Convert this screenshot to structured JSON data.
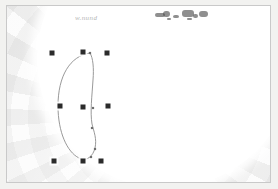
{
  "image": {
    "kind": "scanned-plate",
    "width": 278,
    "height": 189,
    "background_color": "#f2f2f0",
    "plate_color": "#fafafa",
    "frame_color": "#c9c9c9",
    "disc_color": "#ffffff",
    "marker_color": "#2b2b2b",
    "curve_color": "#8d8d8d",
    "node_color": "#6e6e6e",
    "ink_color": "#4a4a4a"
  },
  "annotation": {
    "handwriting_text": "w.nund",
    "handwriting_x": 68,
    "handwriting_y": 8
  },
  "markers": {
    "label": "square-marker",
    "size": 5,
    "points": [
      {
        "id": "m-r1c1",
        "x": 45,
        "y": 47
      },
      {
        "id": "m-r1c2",
        "x": 76,
        "y": 46
      },
      {
        "id": "m-r1c3",
        "x": 100,
        "y": 47
      },
      {
        "id": "m-r2c1",
        "x": 53,
        "y": 100
      },
      {
        "id": "m-r2c2",
        "x": 76,
        "y": 101
      },
      {
        "id": "m-r2c3",
        "x": 101,
        "y": 100
      },
      {
        "id": "m-r3c1",
        "x": 47,
        "y": 155
      },
      {
        "id": "m-r3c2",
        "x": 76,
        "y": 155
      },
      {
        "id": "m-r3c3",
        "x": 94,
        "y": 155
      }
    ]
  },
  "curve": {
    "label": "closed-outline-path",
    "path": "M 83 47 C 63 50 51 70 51 100 C 51 126 60 146 72 152 C 80 156 86 150 88 142 C 90 133 87 126 85 118 C 83 106 85 90 86 74 C 87 62 86 52 83 47 Z",
    "stroke_width": 0.9
  },
  "nodes": {
    "label": "curve-node",
    "size": 2.2,
    "points": [
      {
        "id": "n1",
        "x": 83,
        "y": 47
      },
      {
        "id": "n2",
        "x": 51,
        "y": 100
      },
      {
        "id": "n3",
        "x": 86,
        "y": 102
      },
      {
        "id": "n4",
        "x": 85,
        "y": 122
      },
      {
        "id": "n5",
        "x": 88,
        "y": 143
      },
      {
        "id": "n6",
        "x": 84,
        "y": 151
      }
    ]
  },
  "ink_smudges": {
    "label": "ink-blob",
    "blobs": [
      {
        "id": "b1",
        "x": 148,
        "y": 7,
        "w": 10,
        "h": 4,
        "r": 2
      },
      {
        "id": "b2",
        "x": 156,
        "y": 5,
        "w": 7,
        "h": 6,
        "r": 3
      },
      {
        "id": "b3",
        "x": 166,
        "y": 9,
        "w": 6,
        "h": 3,
        "r": 2
      },
      {
        "id": "b4",
        "x": 175,
        "y": 4,
        "w": 12,
        "h": 7,
        "r": 3
      },
      {
        "id": "b5",
        "x": 186,
        "y": 8,
        "w": 5,
        "h": 4,
        "r": 2
      },
      {
        "id": "b6",
        "x": 192,
        "y": 5,
        "w": 9,
        "h": 6,
        "r": 3
      },
      {
        "id": "b7",
        "x": 160,
        "y": 12,
        "w": 4,
        "h": 2,
        "r": 1
      },
      {
        "id": "b8",
        "x": 180,
        "y": 12,
        "w": 5,
        "h": 2,
        "r": 1
      }
    ]
  }
}
